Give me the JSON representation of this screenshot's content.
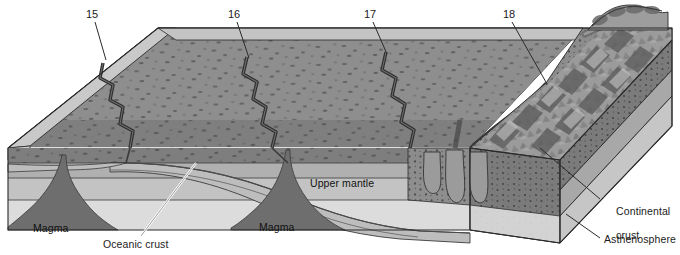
{
  "figure": {
    "type": "geology-block-diagram",
    "background_color": "#ffffff"
  },
  "callouts": [
    {
      "id": "15",
      "label": "15",
      "x": 88,
      "y": 9,
      "leader_to_x": 106,
      "leader_to_y": 60
    },
    {
      "id": "16",
      "label": "16",
      "x": 230,
      "y": 9,
      "leader_to_x": 249,
      "leader_to_y": 56
    },
    {
      "id": "17",
      "label": "17",
      "x": 366,
      "y": 9,
      "leader_to_x": 387,
      "leader_to_y": 52
    },
    {
      "id": "18",
      "label": "18",
      "x": 505,
      "y": 9,
      "leader_to_x": 545,
      "leader_to_y": 82
    }
  ],
  "labels": {
    "upper_mantle": {
      "text": "Upper mantle",
      "x": 310,
      "y": 178
    },
    "magma_left": {
      "text": "Magma",
      "x": 33,
      "y": 224
    },
    "magma_right": {
      "text": "Magma",
      "x": 259,
      "y": 223
    },
    "oceanic_crust": {
      "text": "Oceanic crust",
      "x": 103,
      "y": 239
    },
    "continental_crust": {
      "text_line1": "Continental",
      "text_line2": "crust",
      "x": 604,
      "y": 199
    },
    "asthenosphere": {
      "text": "Asthenosphere",
      "x": 604,
      "y": 238
    }
  },
  "colors": {
    "ocean_surface": "#8c8c8c",
    "ocean_surface_dark": "#7c7c7c",
    "ocean_water_face": "#b9b9b9",
    "ocean_top_sliver": "#cdcdcd",
    "oceanic_crust_band": "#6f6f6f",
    "lithosphere_band": "#9c9c9c",
    "asthenosphere_band": "#b5b5b5",
    "deep_mantle": "#d8d8d8",
    "magma": "#6a6a6a",
    "continental_crust": "#8a8a8a",
    "continent_surface": "#a3a3a3",
    "mountains": "#9a9a9a",
    "outline": "#2a2a2a",
    "leader_line": "#2b2b2b",
    "text": "#1b1b1b"
  },
  "features": {
    "ridges": [
      "15",
      "16",
      "17"
    ],
    "trench": "18",
    "magma_plumes": 2,
    "plutons": 3
  }
}
